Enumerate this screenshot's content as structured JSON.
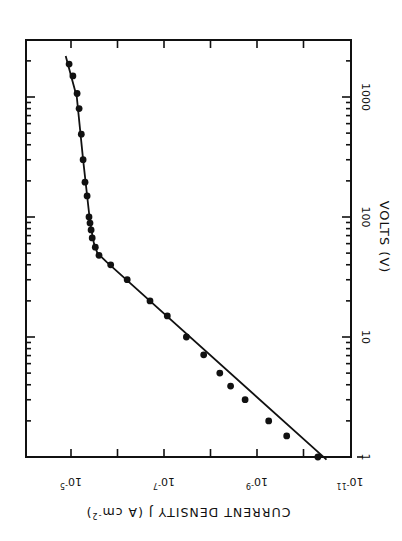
{
  "chart_data": {
    "type": "scatter",
    "orientation": "rotated 90 degrees (page turned sideways)",
    "scale": "log-log",
    "title": "",
    "xlabel": "VOLTS (V)",
    "ylabel": "CURRENT DENSITY  J  (A cm^-2)",
    "ylabel_parts": {
      "main": "CURRENT DENSITY  J  (A cm",
      "sup": "-2",
      "tail": ")"
    },
    "xlim": [
      1,
      2500
    ],
    "ylim": [
      1e-11,
      0.0001
    ],
    "x_ticks": [
      {
        "value": 1,
        "label": "1"
      },
      {
        "value": 10,
        "label": "10"
      },
      {
        "value": 100,
        "label": "100"
      },
      {
        "value": 1000,
        "label": "1000"
      }
    ],
    "y_ticks": [
      {
        "value": 1e-11,
        "base": "10",
        "exp": "-11"
      },
      {
        "value": 1e-09,
        "base": "10",
        "exp": "-9"
      },
      {
        "value": 1e-07,
        "base": "10",
        "exp": "-7"
      },
      {
        "value": 1e-05,
        "base": "10",
        "exp": "-5"
      }
    ],
    "grid": false,
    "legend": null,
    "series": [
      {
        "name": "measured",
        "style": "filled circles",
        "x": [
          1,
          1.5,
          2,
          3,
          3.9,
          5,
          7.1,
          10,
          15,
          20,
          30,
          40,
          48,
          56,
          67,
          78,
          89,
          100,
          150,
          195,
          300,
          490,
          800,
          1070,
          1500,
          1880
        ],
        "y": [
          4.9e-11,
          2.3e-10,
          5.6e-10,
          1.8e-09,
          3.7e-09,
          6.3e-09,
          1.4e-08,
          3.3e-08,
          8.5e-08,
          2e-07,
          6.2e-07,
          1.4e-06,
          2.5e-06,
          3e-06,
          3.5e-06,
          3.7e-06,
          3.9e-06,
          4.1e-06,
          4.5e-06,
          5e-06,
          5.5e-06,
          6e-06,
          6.7e-06,
          7.4e-06,
          9.1e-06,
          1.1e-05
        ]
      },
      {
        "name": "fit",
        "style": "solid line",
        "x": [
          0.95,
          42,
          50,
          60,
          80,
          100,
          300,
          1000,
          2200
        ],
        "y": [
          3.2e-11,
          1.7e-06,
          2.7e-06,
          3.2e-06,
          3.7e-06,
          4e-06,
          5.5e-06,
          7.5e-06,
          1.3e-05
        ]
      }
    ]
  }
}
